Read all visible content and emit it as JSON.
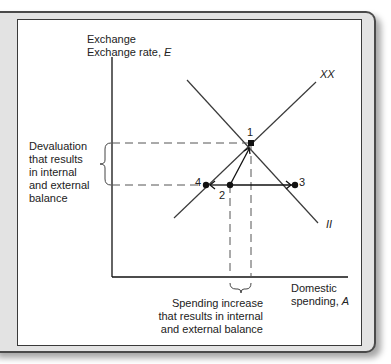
{
  "diagram": {
    "y_axis_label": "Exchange rate,",
    "y_axis_var": "E",
    "x_axis_label_line1": "Domestic",
    "x_axis_label_line2": "spending,",
    "x_axis_var": "A",
    "curve_xx": "XX",
    "curve_ii": "II",
    "points": [
      {
        "label": "1",
        "x": 251,
        "y": 143
      },
      {
        "label": "2",
        "x": 230,
        "y": 185
      },
      {
        "label": "3",
        "x": 295,
        "y": 185
      },
      {
        "label": "4",
        "x": 206,
        "y": 185
      }
    ],
    "left_annotation": [
      "Devaluation",
      "that results",
      "in internal",
      "and external",
      "balance"
    ],
    "bottom_annotation": [
      "Spending increase",
      "that results in internal",
      "and external balance"
    ],
    "colors": {
      "line": "#3a3a3a",
      "frame": "#e3e3e3",
      "point": "#111111"
    }
  }
}
